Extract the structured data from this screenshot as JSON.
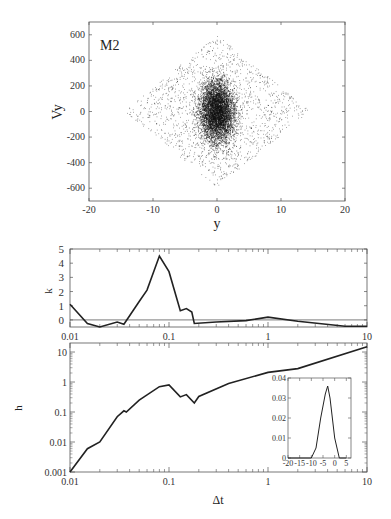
{
  "chart_data": [
    {
      "type": "scatter",
      "panel": "top",
      "annotation": "M2",
      "xlabel": "y",
      "ylabel": "Vy",
      "xlim": [
        -20,
        20
      ],
      "ylim": [
        -700,
        700
      ],
      "xticks": [
        -20,
        -10,
        0,
        10,
        20
      ],
      "yticks": [
        -600,
        -400,
        -200,
        0,
        200,
        400,
        600
      ],
      "description": "Dense point cloud: core concentrated at |y|<5, |Vy|<400; diamond-shaped halo extending to y=±15 at Vy=0 and to Vy=±600 at y=0",
      "envelope": {
        "core": {
          "y_halfwidth": 4.5,
          "vy_halfheight": 400
        },
        "halo_tips": [
          [
            -14.5,
            0
          ],
          [
            14.5,
            0
          ],
          [
            0,
            600
          ],
          [
            0,
            -580
          ]
        ]
      }
    },
    {
      "type": "line",
      "panel": "middle",
      "xlabel": "",
      "ylabel": "k",
      "xscale": "log",
      "xlim": [
        0.01,
        10
      ],
      "ylim": [
        -0.5,
        5
      ],
      "xticks": [
        0.01,
        0.1,
        1,
        10
      ],
      "yticks": [
        0,
        1,
        2,
        3,
        4,
        5
      ],
      "hline": 0,
      "x": [
        0.01,
        0.015,
        0.02,
        0.03,
        0.035,
        0.05,
        0.06,
        0.08,
        0.1,
        0.13,
        0.15,
        0.17,
        0.18,
        0.3,
        0.6,
        1.0,
        2.0,
        6.0,
        10.0
      ],
      "values": [
        1.1,
        -0.25,
        -0.5,
        -0.15,
        -0.3,
        1.3,
        2.1,
        4.5,
        3.4,
        0.65,
        0.8,
        0.55,
        -0.25,
        -0.15,
        -0.05,
        0.2,
        -0.1,
        -0.45,
        -0.45
      ]
    },
    {
      "type": "line",
      "panel": "bottom",
      "xlabel": "Δt",
      "ylabel": "h",
      "xscale": "log",
      "yscale": "log",
      "xlim": [
        0.01,
        10
      ],
      "ylim": [
        0.001,
        20
      ],
      "xticks": [
        0.01,
        0.1,
        1,
        10
      ],
      "yticks": [
        0.001,
        0.01,
        0.1,
        1,
        10
      ],
      "x": [
        0.01,
        0.015,
        0.02,
        0.03,
        0.035,
        0.037,
        0.05,
        0.08,
        0.1,
        0.13,
        0.15,
        0.18,
        0.2,
        0.4,
        1.0,
        2.0,
        10.0
      ],
      "values": [
        0.001,
        0.006,
        0.01,
        0.07,
        0.11,
        0.1,
        0.25,
        0.7,
        0.8,
        0.32,
        0.38,
        0.2,
        0.33,
        0.9,
        2.1,
        2.8,
        15
      ],
      "inset": {
        "type": "line",
        "xlim": [
          -20,
          7
        ],
        "ylim": [
          0,
          0.04
        ],
        "xticks": [
          -20,
          -15,
          -10,
          -5,
          0,
          5
        ],
        "yticks": [
          0,
          0.01,
          0.02,
          0.03,
          0.04
        ],
        "x": [
          -20,
          -10,
          -8,
          -6,
          -4,
          -3,
          -2,
          0,
          2,
          5
        ],
        "values": [
          0,
          0,
          0.005,
          0.02,
          0.032,
          0.036,
          0.03,
          0.01,
          0,
          0
        ]
      }
    }
  ],
  "labels": {
    "top_annotation": "M2",
    "top_xlabel": "y",
    "top_ylabel": "Vy",
    "mid_ylabel": "k",
    "bot_ylabel": "h",
    "bot_xlabel": "Δt"
  }
}
